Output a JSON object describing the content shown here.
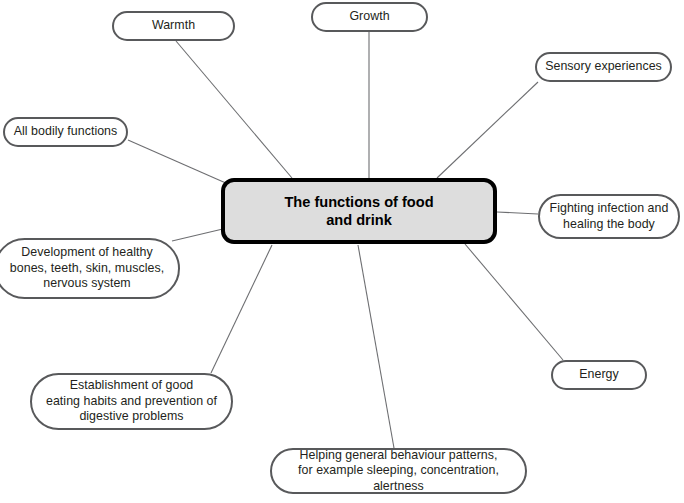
{
  "diagram": {
    "type": "mind-map",
    "title": "The functions of food and drink",
    "center": {
      "label": "The functions of food\nand drink",
      "fill_color": "#dddddd",
      "border_color": "#000000",
      "text_color": "#000000",
      "box": {
        "x": 221,
        "y": 178,
        "w": 276,
        "h": 66
      }
    },
    "style": {
      "background_color": "#ffffff",
      "node_border_color": "#58595b",
      "node_fill_color": "#ffffff",
      "node_text_color": "#231f20",
      "edge_color": "#6d6e71"
    },
    "nodes": [
      {
        "id": "warmth",
        "label": "Warmth",
        "box": {
          "x": 112,
          "y": 11,
          "w": 123,
          "h": 30
        },
        "edge": {
          "x1": 176,
          "y1": 41,
          "x2": 292,
          "y2": 178
        }
      },
      {
        "id": "growth",
        "label": "Growth",
        "box": {
          "x": 311,
          "y": 2,
          "w": 117,
          "h": 30
        },
        "edge": {
          "x1": 369,
          "y1": 32,
          "x2": 369,
          "y2": 178
        }
      },
      {
        "id": "sensory-experiences",
        "label": "Sensory experiences",
        "box": {
          "x": 535,
          "y": 52,
          "w": 137,
          "h": 30
        },
        "edge": {
          "x1": 538,
          "y1": 82,
          "x2": 437,
          "y2": 178
        }
      },
      {
        "id": "all-bodily-functions",
        "label": "All bodily functions",
        "box": {
          "x": 3,
          "y": 117,
          "w": 125,
          "h": 30
        },
        "edge": {
          "x1": 128,
          "y1": 140,
          "x2": 228,
          "y2": 184
        }
      },
      {
        "id": "fighting-infection",
        "label": "Fighting infection and\nhealing the body",
        "box": {
          "x": 538,
          "y": 194,
          "w": 142,
          "h": 45
        },
        "edge": {
          "x1": 538,
          "y1": 214,
          "x2": 497,
          "y2": 212
        }
      },
      {
        "id": "development-of-healthy",
        "label": "Development of healthy\nbones, teeth, skin, muscles,\nnervous system",
        "box": {
          "x": -6,
          "y": 238,
          "w": 186,
          "h": 61
        },
        "edge": {
          "x1": 172,
          "y1": 241,
          "x2": 227,
          "y2": 228
        }
      },
      {
        "id": "energy",
        "label": "Energy",
        "box": {
          "x": 551,
          "y": 360,
          "w": 96,
          "h": 30
        },
        "edge": {
          "x1": 563,
          "y1": 360,
          "x2": 465,
          "y2": 244
        }
      },
      {
        "id": "establishment-of-good-eating-habits",
        "label": "Establishment of good\neating habits and prevention of\ndigestive problems",
        "box": {
          "x": 30,
          "y": 373,
          "w": 203,
          "h": 57
        },
        "edge": {
          "x1": 211,
          "y1": 373,
          "x2": 272,
          "y2": 245
        }
      },
      {
        "id": "helping-general-behaviour",
        "label": "Helping general behaviour patterns,\nfor example sleeping, concentration, alertness",
        "box": {
          "x": 270,
          "y": 448,
          "w": 257,
          "h": 46
        },
        "edge": {
          "x1": 394,
          "y1": 448,
          "x2": 358,
          "y2": 245
        }
      }
    ]
  }
}
